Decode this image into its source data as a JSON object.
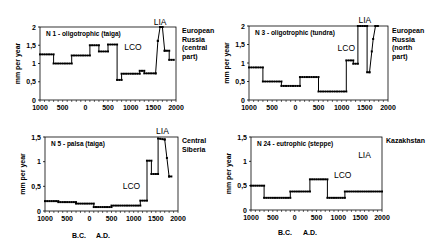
{
  "figure": {
    "ylabel": "mm per year",
    "era_labels": {
      "bc": "B.C.",
      "ad": "A.D."
    }
  },
  "chart_data": [
    {
      "type": "line",
      "id": "n1",
      "title": "N 1  -  oligotrophic (taiga)",
      "region": "European\nRussia\n(central\npart)",
      "xlabel": "",
      "ylabel": "mm per year",
      "xticks": [
        "1000",
        "500",
        "0",
        "500",
        "1000",
        "1500",
        "2000"
      ],
      "yticks": [
        "0",
        "0,5",
        "1",
        "1,5",
        "2"
      ],
      "ylim": [
        0,
        2
      ],
      "xlim": [
        -1000,
        2000
      ],
      "annotations": [
        {
          "text": "LCO",
          "x": 1050,
          "y": 1.45
        },
        {
          "text": "LIA",
          "x": 1650,
          "y": 2.15
        }
      ],
      "x": [
        -1000,
        -700,
        -700,
        -300,
        -300,
        100,
        100,
        300,
        300,
        500,
        500,
        700,
        700,
        800,
        800,
        1200,
        1200,
        1300,
        1300,
        1550,
        1550,
        1600,
        1650,
        1700,
        1700,
        1750,
        1750,
        1850,
        1850,
        1950
      ],
      "y": [
        1.25,
        1.25,
        1.0,
        1.0,
        1.22,
        1.22,
        1.5,
        1.5,
        1.33,
        1.33,
        1.52,
        1.52,
        0.55,
        0.55,
        0.72,
        0.72,
        0.8,
        0.8,
        0.73,
        0.73,
        0.73,
        1.62,
        2.0,
        2.0,
        2.0,
        1.35,
        1.35,
        1.35,
        1.1,
        1.1
      ]
    },
    {
      "type": "line",
      "id": "n3",
      "title": "N 3  -  oligotrophic (tundra)",
      "region": "European\nRussia\n(north\npart)",
      "xlabel": "",
      "ylabel": "mm per year",
      "xticks": [
        "1000",
        "500",
        "0",
        "500",
        "1000",
        "1500",
        "2000"
      ],
      "yticks": [
        "0",
        "0,5",
        "1",
        "1,5",
        "2"
      ],
      "ylim": [
        0,
        2
      ],
      "xlim": [
        -1000,
        2000
      ],
      "annotations": [
        {
          "text": "LCO",
          "x": 1100,
          "y": 1.4
        },
        {
          "text": "LIA",
          "x": 1500,
          "y": 2.15
        }
      ],
      "x": [
        -1000,
        -700,
        -700,
        -300,
        -300,
        100,
        100,
        500,
        500,
        1100,
        1100,
        1250,
        1250,
        1350,
        1350,
        1550,
        1550,
        1600,
        1680,
        1730,
        1800
      ],
      "y": [
        0.88,
        0.88,
        0.5,
        0.5,
        0.38,
        0.38,
        0.62,
        0.62,
        0.23,
        0.23,
        1.07,
        1.07,
        0.98,
        0.98,
        2.0,
        2.0,
        0.75,
        0.75,
        1.65,
        2.0,
        2.0
      ]
    },
    {
      "type": "line",
      "id": "n5",
      "title": "N 5  -  palsa (taiga)",
      "region": "Central\nSiberia",
      "xlabel": "",
      "ylabel": "mm per year",
      "xticks": [
        "1000",
        "500",
        "0",
        "500",
        "1000",
        "1500",
        "2000"
      ],
      "yticks": [
        "0",
        "0,5",
        "1",
        "1,5"
      ],
      "ylim": [
        0,
        1.5
      ],
      "xlim": [
        -1000,
        2000
      ],
      "annotations": [
        {
          "text": "LCO",
          "x": 950,
          "y": 0.5
        },
        {
          "text": "LIA",
          "x": 1650,
          "y": 1.62
        }
      ],
      "x": [
        -1000,
        -700,
        -700,
        -300,
        -300,
        100,
        100,
        500,
        500,
        1150,
        1150,
        1300,
        1300,
        1400,
        1400,
        1550,
        1550,
        1700,
        1700,
        1800,
        1800,
        1850
      ],
      "y": [
        0.2,
        0.2,
        0.18,
        0.18,
        0.15,
        0.15,
        0.08,
        0.08,
        0.11,
        0.11,
        0.21,
        0.21,
        1.02,
        1.02,
        0.75,
        0.75,
        1.47,
        1.45,
        1.45,
        0.7,
        0.7,
        0.7
      ]
    },
    {
      "type": "line",
      "id": "n24",
      "title": "N 24  -  eutrophic (steppe)",
      "region": "Kazakhstan",
      "xlabel": "",
      "ylabel": "mm per year",
      "xticks": [
        "1000",
        "500",
        "0",
        "500",
        "1000",
        "1500",
        "2000"
      ],
      "yticks": [
        "0",
        "0,5",
        "1",
        "1,5"
      ],
      "ylim": [
        0,
        1.5
      ],
      "xlim": [
        -1000,
        2000
      ],
      "annotations": [
        {
          "text": "LCO",
          "x": 1100,
          "y": 0.72
        },
        {
          "text": "LIA",
          "x": 1600,
          "y": 1.12
        }
      ],
      "x": [
        -1000,
        -700,
        -700,
        -100,
        -100,
        350,
        350,
        750,
        750,
        1150,
        1150,
        2000
      ],
      "y": [
        0.5,
        0.5,
        0.25,
        0.25,
        0.38,
        0.38,
        0.63,
        0.63,
        0.25,
        0.25,
        0.38,
        0.38
      ]
    }
  ]
}
